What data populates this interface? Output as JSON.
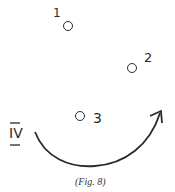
{
  "figure": {
    "caption": "(Fig. 8)",
    "points": [
      {
        "label": "1",
        "marker": "circle"
      },
      {
        "label": "2",
        "marker": "circle"
      },
      {
        "label": "3",
        "marker": "circle"
      }
    ],
    "roman_label": "IV",
    "arrow": {
      "direction": "clockwise-arc",
      "description": "curved arrow from IV sweeping under point 3 up to the right"
    },
    "stroke_color": "#2a2a2a"
  }
}
